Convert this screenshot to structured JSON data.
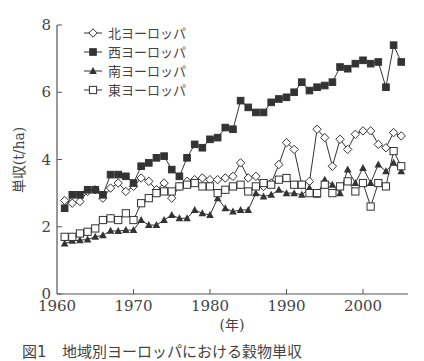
{
  "chart_data": {
    "type": "line",
    "title": "",
    "xlabel": "(年)",
    "ylabel": "単収(t/ha)",
    "xlim": [
      1960,
      2006
    ],
    "ylim": [
      0,
      8
    ],
    "x_ticks": [
      1960,
      1970,
      1980,
      1990,
      2000
    ],
    "y_ticks": [
      0,
      2,
      4,
      6,
      8
    ],
    "grid": false,
    "legend_position": "top-left",
    "x": [
      1961,
      1962,
      1963,
      1964,
      1965,
      1966,
      1967,
      1968,
      1969,
      1970,
      1971,
      1972,
      1973,
      1974,
      1975,
      1976,
      1977,
      1978,
      1979,
      1980,
      1981,
      1982,
      1983,
      1984,
      1985,
      1986,
      1987,
      1988,
      1989,
      1990,
      1991,
      1992,
      1993,
      1994,
      1995,
      1996,
      1997,
      1998,
      1999,
      2000,
      2001,
      2002,
      2003,
      2004,
      2005
    ],
    "series": [
      {
        "name": "北ヨーロッパ",
        "marker": "diamond-open",
        "values": [
          2.78,
          2.7,
          2.75,
          3.05,
          3.1,
          2.85,
          3.15,
          3.3,
          3.05,
          3.2,
          3.45,
          3.35,
          3.1,
          3.3,
          2.85,
          3.2,
          3.35,
          3.4,
          3.45,
          3.4,
          3.4,
          3.45,
          3.5,
          3.9,
          3.45,
          3.5,
          3.2,
          3.3,
          3.85,
          4.5,
          4.3,
          3.25,
          3.35,
          4.9,
          4.65,
          3.8,
          4.6,
          4.3,
          4.75,
          4.85,
          4.85,
          4.45,
          4.35,
          4.8,
          4.7
        ]
      },
      {
        "name": "西ヨーロッパ",
        "marker": "square-filled",
        "values": [
          2.55,
          2.95,
          2.95,
          3.1,
          3.1,
          2.95,
          3.55,
          3.55,
          3.5,
          3.3,
          3.8,
          3.9,
          4.05,
          4.1,
          3.7,
          3.5,
          4.05,
          4.45,
          4.35,
          4.6,
          4.65,
          4.95,
          4.9,
          5.75,
          5.55,
          5.4,
          5.4,
          5.7,
          5.8,
          5.85,
          6.0,
          6.3,
          6.05,
          6.15,
          6.2,
          6.3,
          6.75,
          6.7,
          6.85,
          6.95,
          6.85,
          6.9,
          6.15,
          7.4,
          6.9
        ]
      },
      {
        "name": "南ヨーロッパ",
        "marker": "triangle-filled",
        "values": [
          1.5,
          1.58,
          1.6,
          1.62,
          1.7,
          1.75,
          1.88,
          1.87,
          1.9,
          1.9,
          2.2,
          2.05,
          2.05,
          2.2,
          2.35,
          2.25,
          2.25,
          2.5,
          2.4,
          2.35,
          2.85,
          2.55,
          2.45,
          2.5,
          2.5,
          3.0,
          2.9,
          2.95,
          3.1,
          3.0,
          3.0,
          2.95,
          3.15,
          2.95,
          3.4,
          3.25,
          3.0,
          3.7,
          3.3,
          3.75,
          3.3,
          3.85,
          3.65,
          3.9,
          3.65
        ]
      },
      {
        "name": "東ヨーロッパ",
        "marker": "square-open",
        "values": [
          1.7,
          1.7,
          1.8,
          1.85,
          1.95,
          2.2,
          2.25,
          2.2,
          2.4,
          2.2,
          2.7,
          2.85,
          3.0,
          3.05,
          3.05,
          3.2,
          3.25,
          3.3,
          3.2,
          3.2,
          3.0,
          3.1,
          3.2,
          3.25,
          3.05,
          3.2,
          3.3,
          3.25,
          3.4,
          3.45,
          3.25,
          3.25,
          3.0,
          3.0,
          3.25,
          3.0,
          3.2,
          3.35,
          3.05,
          3.3,
          2.6,
          3.3,
          3.2,
          4.25,
          3.8
        ]
      }
    ],
    "colors": {
      "line": "#333333",
      "axis": "#555555",
      "text": "#444444"
    }
  },
  "legend": {
    "items": [
      {
        "label": "北ヨーロッパ",
        "marker": "diamond-open"
      },
      {
        "label": "西ヨーロッパ",
        "marker": "square-filled"
      },
      {
        "label": "南ヨーロッパ",
        "marker": "triangle-filled"
      },
      {
        "label": "東ヨーロッパ",
        "marker": "square-open"
      }
    ]
  },
  "axes": {
    "y_label": "単収(t/ha)",
    "x_label": "(年)",
    "x_tick_labels": [
      "1960",
      "1970",
      "1980",
      "1990",
      "2000"
    ],
    "y_tick_labels": [
      "0",
      "2",
      "4",
      "6",
      "8"
    ]
  },
  "caption": "図1　地域別ヨーロッパにおける穀物単収"
}
